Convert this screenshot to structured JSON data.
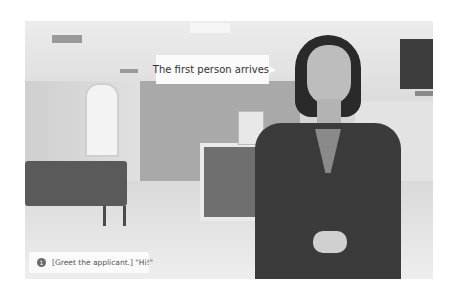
{
  "scene": {
    "description": "Waiting room / reception office with presenter"
  },
  "speech_bubble": {
    "text": "The first person arrives."
  },
  "choices": [
    {
      "number": "1",
      "text": "[Greet the applicant.] \"Hi!\""
    }
  ]
}
